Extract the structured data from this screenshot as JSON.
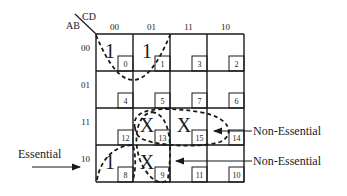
{
  "kmap": {
    "row_var": "AB",
    "col_var": "CD",
    "col_headers": [
      "00",
      "01",
      "11",
      "10"
    ],
    "row_headers": [
      "00",
      "01",
      "11",
      "10"
    ],
    "cells": [
      [
        {
          "value": "1",
          "index": "0"
        },
        {
          "value": "1",
          "index": "1"
        },
        {
          "value": "",
          "index": "3"
        },
        {
          "value": "",
          "index": "2"
        }
      ],
      [
        {
          "value": "",
          "index": "4"
        },
        {
          "value": "",
          "index": "5"
        },
        {
          "value": "",
          "index": "7"
        },
        {
          "value": "",
          "index": "6"
        }
      ],
      [
        {
          "value": "",
          "index": "12"
        },
        {
          "value": "X",
          "index": "13"
        },
        {
          "value": "X",
          "index": "15"
        },
        {
          "value": "",
          "index": "14"
        }
      ],
      [
        {
          "value": "1",
          "index": "8"
        },
        {
          "value": "X",
          "index": "9"
        },
        {
          "value": "",
          "index": "11"
        },
        {
          "value": "",
          "index": "10"
        }
      ]
    ]
  },
  "annotations": {
    "essential": "Essential",
    "non_essential_1": "Non-Essential",
    "non_essential_2": "Non-Essential"
  }
}
